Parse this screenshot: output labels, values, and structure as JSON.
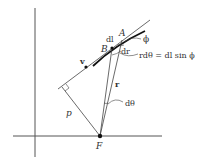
{
  "diagram": {
    "type": "geometry",
    "labels": {
      "A": "A",
      "B": "B",
      "dl": "dl",
      "dr": "dr",
      "phi": "ϕ",
      "v": "v",
      "r": "r",
      "p": "p",
      "dtheta": "dθ",
      "F": "F",
      "relation": "rdθ = dl sin ϕ"
    },
    "points": {
      "F": [
        100,
        136
      ],
      "A": [
        122,
        40
      ],
      "B": [
        112,
        48
      ],
      "v_dot": [
        86,
        67
      ],
      "perp_foot": [
        62,
        87
      ]
    },
    "colors": {
      "line": "#333333",
      "thick": "#111111"
    }
  }
}
